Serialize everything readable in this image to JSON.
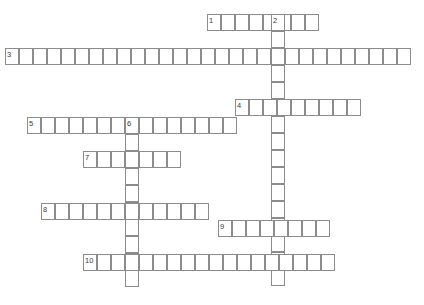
{
  "puzzle": {
    "type": "crossword-grid",
    "title": "",
    "width": 424,
    "height": 305,
    "cell_width": 14,
    "cell_height": 17,
    "grid_color": "#8c8c8c",
    "cell_fill": "#ffffff",
    "background": "#ffffff",
    "number_color": "#3a3a3a",
    "across_label": "",
    "down_label": "",
    "entries": [
      {
        "number": "1",
        "direction": "across",
        "length": 8,
        "x": 207,
        "y": 14,
        "value": ""
      },
      {
        "number": "2",
        "direction": "down",
        "length": 16,
        "x": 271,
        "y": 14,
        "value": ""
      },
      {
        "number": "3",
        "direction": "across",
        "length": 29,
        "x": 5,
        "y": 48,
        "value": ""
      },
      {
        "number": "4",
        "direction": "across",
        "length": 9,
        "x": 235,
        "y": 99,
        "value": ""
      },
      {
        "number": "5",
        "direction": "across",
        "length": 15,
        "x": 27,
        "y": 117,
        "value": ""
      },
      {
        "number": "6",
        "direction": "down",
        "length": 10,
        "x": 125,
        "y": 117,
        "value": ""
      },
      {
        "number": "7",
        "direction": "across",
        "length": 7,
        "x": 83,
        "y": 151,
        "value": ""
      },
      {
        "number": "8",
        "direction": "across",
        "length": 12,
        "x": 41,
        "y": 203,
        "value": ""
      },
      {
        "number": "9",
        "direction": "across",
        "length": 8,
        "x": 218,
        "y": 220,
        "value": ""
      },
      {
        "number": "10",
        "direction": "across",
        "length": 18,
        "x": 83,
        "y": 254,
        "value": ""
      }
    ],
    "numbers": [
      {
        "label": "1",
        "x": 209,
        "y": 17
      },
      {
        "label": "2",
        "x": 273,
        "y": 17
      },
      {
        "label": "3",
        "x": 7,
        "y": 51
      },
      {
        "label": "4",
        "x": 237,
        "y": 102
      },
      {
        "label": "5",
        "x": 29,
        "y": 120
      },
      {
        "label": "6",
        "x": 127,
        "y": 120
      },
      {
        "label": "7",
        "x": 85,
        "y": 154
      },
      {
        "label": "8",
        "x": 43,
        "y": 206
      },
      {
        "label": "9",
        "x": 220,
        "y": 223
      },
      {
        "label": "10",
        "x": 85,
        "y": 257
      }
    ]
  }
}
